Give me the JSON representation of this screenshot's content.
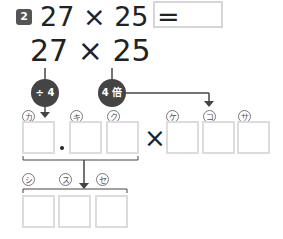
{
  "problem": {
    "number": "2",
    "expression": "27 × 25 =",
    "answer_value": ""
  },
  "expression_large": "27 × 25",
  "operations": {
    "left": "÷ 4",
    "right": "4 倍"
  },
  "row1": {
    "labels": [
      "カ",
      "キ",
      "ク",
      "ケ",
      "コ",
      "サ"
    ],
    "decimal_point": "・",
    "times": "×"
  },
  "row2": {
    "labels": [
      "シ",
      "ス",
      "セ"
    ]
  }
}
